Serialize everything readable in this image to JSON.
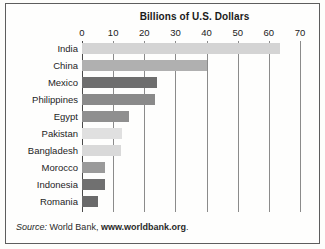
{
  "figure": {
    "title": "Billions of U.S. Dollars",
    "source_prefix": "Source:",
    "source_org": " World Bank,",
    "source_url": "www.worldbank.org",
    "source_suffix": ".",
    "border_color": "#5d5d5d",
    "background_color": "#fefefd",
    "gridline_color": "#8b8b8b"
  },
  "chart_data": {
    "type": "bar",
    "orientation": "horizontal",
    "title": "Billions of U.S. Dollars",
    "xlabel": "Billions of U.S. Dollars",
    "ylabel": "",
    "xlim": [
      0,
      70
    ],
    "xticks": [
      0,
      10,
      20,
      30,
      40,
      50,
      60,
      70
    ],
    "xtick_labels": [
      "0",
      "10",
      "20",
      "30",
      "40",
      "50",
      "60",
      "70"
    ],
    "grid": true,
    "grid_axis": "x",
    "legend": false,
    "categories": [
      "India",
      "China",
      "Mexico",
      "Philippines",
      "Egypt",
      "Pakistan",
      "Bangladesh",
      "Morocco",
      "Indonesia",
      "Romania"
    ],
    "values": [
      63.5,
      40.0,
      24.0,
      23.5,
      15.0,
      13.0,
      12.5,
      7.5,
      7.5,
      5.0
    ],
    "bar_colors": [
      "#d4d4d4",
      "#b0b0b0",
      "#6e6e6e",
      "#8a8a8a",
      "#8f8f8f",
      "#e0e0e0",
      "#d9d9d9",
      "#9a9a9a",
      "#707070",
      "#6a6a6a"
    ],
    "bars": [
      {
        "label": "India",
        "value": 63.5,
        "color": "#d4d4d4"
      },
      {
        "label": "China",
        "value": 40.0,
        "color": "#b0b0b0"
      },
      {
        "label": "Mexico",
        "value": 24.0,
        "color": "#6e6e6e"
      },
      {
        "label": "Philippines",
        "value": 23.5,
        "color": "#8a8a8a"
      },
      {
        "label": "Egypt",
        "value": 15.0,
        "color": "#8f8f8f"
      },
      {
        "label": "Pakistan",
        "value": 13.0,
        "color": "#e0e0e0"
      },
      {
        "label": "Bangladesh",
        "value": 12.5,
        "color": "#d9d9d9"
      },
      {
        "label": "Morocco",
        "value": 7.5,
        "color": "#9a9a9a"
      },
      {
        "label": "Indonesia",
        "value": 7.5,
        "color": "#707070"
      },
      {
        "label": "Romania",
        "value": 5.0,
        "color": "#6a6a6a"
      }
    ]
  }
}
